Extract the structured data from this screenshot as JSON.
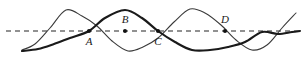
{
  "figure": {
    "background_color": "#ffffff",
    "width": 308,
    "height": 57
  },
  "axis": {
    "name": "equilibrium-axis",
    "style": "dashed",
    "color": "#6e6e6e",
    "y": 31,
    "x_start": 6,
    "x_end": 302,
    "dash_pattern": "5 4",
    "stroke_width": 1.4
  },
  "labels": [
    {
      "id": "A",
      "text": "A",
      "x": 89,
      "y": 42,
      "dot_x": 89,
      "dot_y": 31
    },
    {
      "id": "B",
      "text": "B",
      "x": 125,
      "y": 20,
      "dot_x": 125,
      "dot_y": 31
    },
    {
      "id": "C",
      "text": "C",
      "x": 158,
      "y": 42,
      "dot_x": 158,
      "dot_y": 31
    },
    {
      "id": "D",
      "text": "D",
      "x": 225,
      "y": 20,
      "dot_x": 225,
      "dot_y": 31
    }
  ],
  "dot": {
    "radius": 2.0,
    "color": "#111111"
  },
  "chart_data": {
    "type": "line",
    "title": "",
    "xlabel": "",
    "ylabel": "",
    "xlim": [
      22,
      296
    ],
    "ylim": [
      9,
      51
    ],
    "grid": false,
    "legend": false,
    "axis_line_y": 31,
    "series": [
      {
        "name": "thin-wave",
        "color": "#3a3a3a",
        "stroke_width": 1.1,
        "amplitude": 21,
        "wavelength": 124,
        "phase_deg": 0,
        "description": "Thin sine wave: rises from trough at left end, crest near x=66, trough near x=128, crest near x=190, trough near x=252, rising at right edge",
        "x": [
          22,
          35,
          50,
          66,
          82,
          97,
          112,
          128,
          143,
          158,
          174,
          190,
          205,
          221,
          236,
          252,
          267,
          282,
          296
        ],
        "y": [
          50,
          44,
          28,
          10,
          16,
          26,
          41,
          51,
          47,
          38,
          22,
          9,
          13,
          25,
          40,
          50,
          45,
          28,
          13
        ]
      },
      {
        "name": "thick-wave",
        "color": "#1a1a1a",
        "stroke_width": 2.1,
        "amplitude": 21,
        "wavelength": 134,
        "phase_deg": -170,
        "description": "Thick sine wave: starts at trough at left end, rises through axis near x=89, crest near x=125, falls through axis near x=158, trough near x=192, rising through axis near x=262, crest approaching at right edge",
        "x": [
          22,
          38,
          54,
          70,
          89,
          105,
          125,
          142,
          158,
          175,
          192,
          210,
          228,
          245,
          262,
          278,
          292,
          300
        ],
        "y": [
          51,
          49,
          44,
          38,
          31,
          18,
          10,
          18,
          31,
          42,
          50,
          50,
          47,
          42,
          32,
          34,
          32,
          31
        ]
      }
    ]
  }
}
